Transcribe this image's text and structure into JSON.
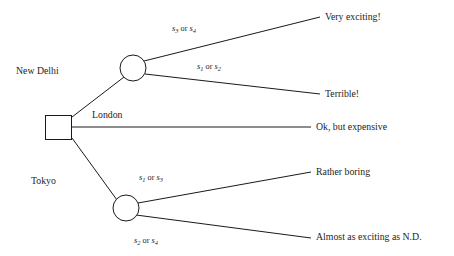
{
  "figure": {
    "type": "decision-tree",
    "background_color": "#ffffff",
    "line_color": "#1a1a1a",
    "text_color": "#1d1d1d"
  },
  "nodes": {
    "decision": {
      "shape": "square",
      "x": 45,
      "y": 115,
      "w": 27,
      "h": 25
    },
    "chance_top": {
      "shape": "circle",
      "cx": 133,
      "cy": 68,
      "r": 13
    },
    "chance_bottom": {
      "shape": "circle",
      "cx": 126,
      "cy": 208,
      "r": 13
    }
  },
  "branches": {
    "new_delhi": {
      "label": "New Delhi",
      "x": 16,
      "y": 66
    },
    "london": {
      "label": "London",
      "x": 92,
      "y": 110
    },
    "tokyo": {
      "label": "Tokyo",
      "x": 31,
      "y": 176
    }
  },
  "state_labels": [
    {
      "id": "top-upper",
      "text": "s3 or s4",
      "s_first": "s",
      "sub_first": "3",
      "conj": " or ",
      "s_second": "s",
      "sub_second": "4",
      "x": 172,
      "y": 24
    },
    {
      "id": "top-lower",
      "text": "s1 or s2",
      "s_first": "s",
      "sub_first": "1",
      "conj": " or ",
      "s_second": "s",
      "sub_second": "2",
      "x": 197,
      "y": 62
    },
    {
      "id": "bottom-upper",
      "text": "s1 or s3",
      "s_first": "s",
      "sub_first": "1",
      "conj": " or ",
      "s_second": "s",
      "sub_second": "3",
      "x": 139,
      "y": 173
    },
    {
      "id": "bottom-lower",
      "text": "s2 or s4",
      "s_first": "s",
      "sub_first": "2",
      "conj": " or ",
      "s_second": "s",
      "sub_second": "4",
      "x": 134,
      "y": 236
    }
  ],
  "outcomes": [
    {
      "id": "very-exciting",
      "label": "Very exciting!",
      "x": 325,
      "y": 12
    },
    {
      "id": "terrible",
      "label": "Terrible!",
      "x": 325,
      "y": 89
    },
    {
      "id": "ok-but-expensive",
      "label": "Ok, but expensive",
      "x": 316,
      "y": 122
    },
    {
      "id": "rather-boring",
      "label": "Rather boring",
      "x": 316,
      "y": 167
    },
    {
      "id": "almost-as-exciting",
      "label": "Almost as exciting as N.D.",
      "x": 316,
      "y": 232
    }
  ],
  "edges": [
    {
      "id": "decision-to-new-delhi",
      "from": "decision",
      "to": "chance_top"
    },
    {
      "id": "decision-to-london",
      "from": "decision",
      "to": "ok-but-expensive"
    },
    {
      "id": "decision-to-tokyo",
      "from": "decision",
      "to": "chance_bottom"
    },
    {
      "id": "chance-top-to-very-exciting",
      "from": "chance_top",
      "to": "very-exciting"
    },
    {
      "id": "chance-top-to-terrible",
      "from": "chance_top",
      "to": "terrible"
    },
    {
      "id": "chance-bottom-to-rather-boring",
      "from": "chance_bottom",
      "to": "rather-boring"
    },
    {
      "id": "chance-bottom-to-almost-as-exciting",
      "from": "chance_bottom",
      "to": "almost-as-exciting"
    }
  ]
}
